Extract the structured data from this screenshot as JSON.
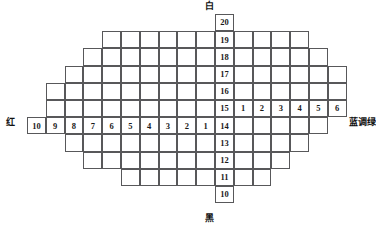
{
  "diagram": {
    "title_axis_labels": {
      "top": "白",
      "bottom": "黑",
      "left": "红",
      "right": "蓝调绿"
    },
    "vertical_axis": {
      "name": "value-axis",
      "direction": "white-top-to-black-bottom",
      "values": [
        20,
        19,
        18,
        17,
        16,
        15,
        14,
        13,
        12,
        11,
        10
      ]
    },
    "left_axis": {
      "name": "red-chroma-axis",
      "values": [
        10,
        9,
        8,
        7,
        6,
        5,
        4,
        3,
        2,
        1
      ]
    },
    "right_axis": {
      "name": "blue-green-chroma-axis",
      "values": [
        1,
        2,
        3,
        4,
        5,
        6
      ]
    },
    "colors": {
      "line": "#58585a",
      "text": "#1a1a1a",
      "background": "#ffffff"
    },
    "rows": [
      {
        "value": 20,
        "left_cols": 0,
        "right_cols": 0
      },
      {
        "value": 19,
        "left_cols": 6,
        "right_cols": 4
      },
      {
        "value": 18,
        "left_cols": 7,
        "right_cols": 5
      },
      {
        "value": 17,
        "left_cols": 8,
        "right_cols": 6
      },
      {
        "value": 16,
        "left_cols": 9,
        "right_cols": 6
      },
      {
        "value": 15,
        "left_cols": 9,
        "right_cols": 6
      },
      {
        "value": 14,
        "left_cols": 10,
        "right_cols": 5
      },
      {
        "value": 13,
        "left_cols": 8,
        "right_cols": 4
      },
      {
        "value": 12,
        "left_cols": 7,
        "right_cols": 3
      },
      {
        "value": 11,
        "left_cols": 5,
        "right_cols": 2
      },
      {
        "value": 10,
        "left_cols": 0,
        "right_cols": 0
      }
    ],
    "labeled_row_left": 14,
    "labeled_row_right": 15,
    "cell_size": {
      "width": 18.8,
      "height": 17.2
    }
  }
}
